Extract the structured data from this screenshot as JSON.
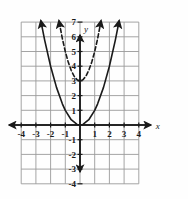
{
  "figure": {
    "kind": "cartesian-coordinate-plane",
    "background_color": "#fefefe",
    "grid_color": "#9a9a9a",
    "axis_color": "#1a1a1a",
    "curve_color": "#1a1a1a"
  },
  "axes": {
    "x_axis_label": "x",
    "y_axis_label": "y",
    "x_min": -4,
    "x_max": 4,
    "y_min": -4,
    "y_max": 7,
    "x_tick_labels": [
      "-4",
      "-3",
      "-2",
      "-1",
      "1",
      "2",
      "3",
      "4"
    ],
    "y_tick_labels": [
      "7",
      "6",
      "5",
      "4",
      "3",
      "2",
      "1",
      "-1",
      "-2",
      "-3",
      "-4"
    ],
    "grid": true,
    "grid_step": 1
  },
  "chart_data": {
    "type": "line",
    "title": "",
    "xlabel": "x",
    "ylabel": "y",
    "xlim": [
      -4,
      4
    ],
    "ylim": [
      -4,
      7
    ],
    "grid": true,
    "legend": "none",
    "series": [
      {
        "name": "solid-parabola",
        "equation": "y = x^2",
        "style": "solid",
        "color": "#1a1a1a",
        "vertex": [
          0,
          0
        ],
        "arrowheads": [
          "left-end-up",
          "right-end-up"
        ],
        "x": [
          -2.646,
          -2.4,
          -2.0,
          -1.6,
          -1.2,
          -1.0,
          -0.6,
          -0.2,
          0,
          0.2,
          0.6,
          1.0,
          1.2,
          1.6,
          2.0,
          2.4,
          2.646
        ],
        "y": [
          7.0,
          5.76,
          4.0,
          2.56,
          1.44,
          1.0,
          0.36,
          0.04,
          0,
          0.04,
          0.36,
          1.0,
          1.44,
          2.56,
          4.0,
          5.76,
          7.0
        ]
      },
      {
        "name": "dashed-parabola",
        "equation": "y = 2x^2 + 3",
        "style": "dashed",
        "color": "#1a1a1a",
        "vertex": [
          0,
          3
        ],
        "arrowheads": [
          "left-end-up",
          "right-end-up"
        ],
        "x": [
          -1.414,
          -1.2,
          -1.0,
          -0.8,
          -0.6,
          -0.4,
          -0.2,
          0,
          0.2,
          0.4,
          0.6,
          0.8,
          1.0,
          1.2,
          1.414
        ],
        "y": [
          7.0,
          5.88,
          5.0,
          4.28,
          3.72,
          3.32,
          3.08,
          3.0,
          3.08,
          3.32,
          3.72,
          4.28,
          5.0,
          5.88,
          7.0
        ]
      }
    ]
  }
}
